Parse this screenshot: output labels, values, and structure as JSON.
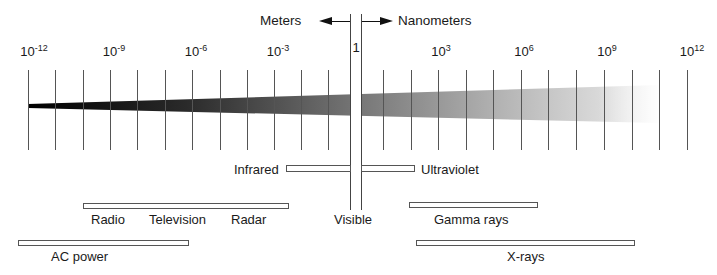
{
  "diagram": {
    "direction_labels": {
      "left": "Meters",
      "right": "Nanometers"
    },
    "scale": {
      "ticks": [
        {
          "base": "10",
          "exp": "-12",
          "x": 28
        },
        {
          "base": "10",
          "exp": "-9",
          "x": 110
        },
        {
          "base": "10",
          "exp": "-6",
          "x": 192
        },
        {
          "base": "10",
          "exp": "-3",
          "x": 274
        },
        {
          "base": "1",
          "exp": "",
          "x": 355
        },
        {
          "base": "10",
          "exp": "3",
          "x": 438
        },
        {
          "base": "10",
          "exp": "6",
          "x": 521
        },
        {
          "base": "10",
          "exp": "9",
          "x": 604
        },
        {
          "base": "10",
          "exp": "12",
          "x": 687
        }
      ],
      "minor_tick_positions": [
        28,
        55,
        83,
        110,
        137,
        165,
        192,
        220,
        247,
        274,
        301,
        328,
        383,
        411,
        438,
        466,
        493,
        521,
        548,
        576,
        604,
        632,
        659,
        687
      ]
    },
    "band": {
      "description": "Gradient wedge from black (left, thin) to light gray (right, wide)",
      "color_start": "#000000",
      "color_end": "#e6e6e6"
    },
    "regions": [
      {
        "name": "Infrared",
        "label": "Infrared",
        "bar": {
          "x1": 286,
          "x2": 350,
          "y": 165
        }
      },
      {
        "name": "Ultraviolet",
        "label": "Ultraviolet",
        "bar": {
          "x1": 361,
          "x2": 414,
          "y": 165
        }
      },
      {
        "name": "Visible",
        "label": "Visible"
      },
      {
        "name": "Radio-Television-Radar",
        "labels": [
          "Radio",
          "Television",
          "Radar"
        ],
        "bar": {
          "x1": 83,
          "x2": 288,
          "y": 203
        }
      },
      {
        "name": "Gamma rays",
        "label": "Gamma rays",
        "bar": {
          "x1": 409,
          "x2": 537,
          "y": 202
        }
      },
      {
        "name": "AC power",
        "label": "AC power",
        "bar": {
          "x1": 18,
          "x2": 188,
          "y": 240
        }
      },
      {
        "name": "X-rays",
        "label": "X-rays",
        "bar": {
          "x1": 416,
          "x2": 634,
          "y": 240
        }
      }
    ]
  }
}
